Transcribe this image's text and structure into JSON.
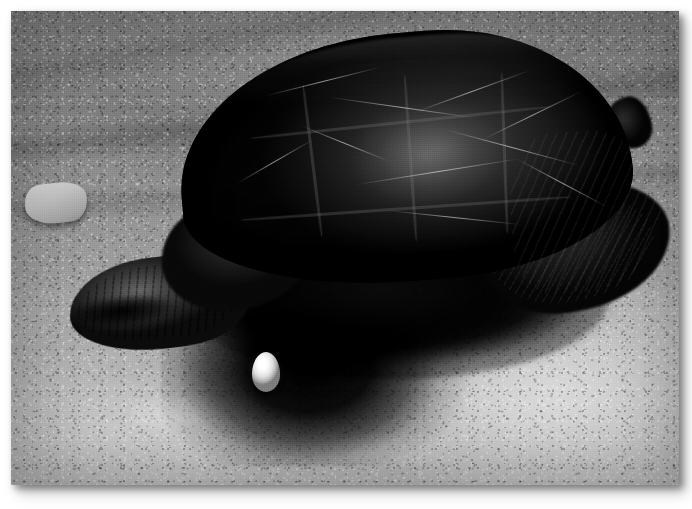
{
  "page": {
    "background_color": "#ffffff",
    "width": 692,
    "height": 509
  },
  "photo": {
    "name": "snapping-turtle-laying-egg",
    "frame": {
      "left": 11,
      "top": 11,
      "width": 668,
      "height": 474,
      "shadow": "drop-shadow-bottom-right"
    },
    "medium": "black-and-white photograph",
    "palette": {
      "shell_darkest": "#0a0a0a",
      "shell_mid": "#383633",
      "shell_highlight": "#4a4845",
      "ground_light": "#c9c6c0",
      "ground_mid": "#a5a29b",
      "ground_dark": "#7b7975",
      "egg_white": "#ffffff",
      "nest_hole_black": "#040404",
      "frame_border": "#ffffff"
    },
    "subjects": [
      {
        "name": "turtle",
        "label": "Snapping turtle",
        "description": "Large dark-shelled turtle facing left, body angled across the frame",
        "parts": [
          {
            "name": "carapace",
            "label": "Carapace",
            "note": "domed ridged shell with pale scratch marks and scute seams"
          },
          {
            "name": "marginal-scutes",
            "label": "Marginal scutes",
            "note": "serrated rear edge of shell"
          },
          {
            "name": "rear-leg",
            "label": "Rear leg",
            "note": "scaly thigh mass at lower right"
          },
          {
            "name": "tail-nub",
            "label": "Tail",
            "note": "small dark projection at far right"
          },
          {
            "name": "front-leg",
            "label": "Front leg and claw",
            "note": "wrinkled limb at left, braced on gravel"
          },
          {
            "name": "shoulder",
            "label": "Shoulder folds",
            "note": "neck and shoulder skin folds"
          },
          {
            "name": "plastron-shadow",
            "label": "Underbody",
            "note": "deep black shadow beneath the shell"
          }
        ]
      },
      {
        "name": "egg",
        "label": "Egg",
        "description": "Single bright white spherical egg dropping into the nest hole",
        "position": {
          "left": 241,
          "top": 341,
          "width": 28,
          "height": 40
        }
      },
      {
        "name": "nest-hole",
        "label": "Nest hole",
        "description": "Dark excavated cavity in the gravel beneath the turtle"
      },
      {
        "name": "ground",
        "label": "Gravel ground",
        "description": "Coarse sandy gravel with scattered light and dark pebbles; brighter sunlit bank at lower right"
      },
      {
        "name": "left-rock",
        "label": "Flat rock",
        "description": "Pale angular stone at the left edge of the frame"
      }
    ]
  }
}
